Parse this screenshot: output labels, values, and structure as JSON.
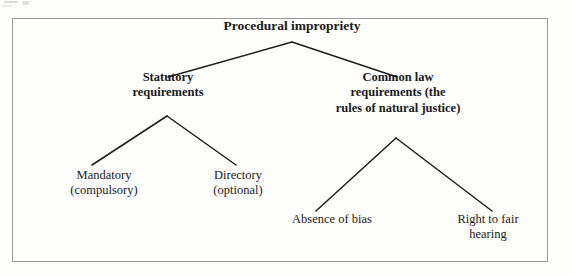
{
  "diagram": {
    "type": "tree",
    "title_node": "Procedural impropriety",
    "nodes": {
      "root": {
        "label": "Procedural impropriety",
        "lines": [
          "Procedural impropriety"
        ],
        "emphasis": "bold"
      },
      "statutory": {
        "label": "Statutory requirements",
        "lines": [
          "Statutory",
          "requirements"
        ],
        "emphasis": "bold"
      },
      "common_law": {
        "label": "Common law requirements (the rules of natural justice)",
        "lines": [
          "Common law",
          "requirements (the",
          "rules of natural justice)"
        ],
        "emphasis": "bold"
      },
      "mandatory": {
        "label": "Mandatory (compulsory)",
        "lines": [
          "Mandatory",
          "(compulsory)"
        ],
        "emphasis": "regular"
      },
      "directory": {
        "label": "Directory (optional)",
        "lines": [
          "Directory",
          "(optional)"
        ],
        "emphasis": "regular"
      },
      "absence_of_bias": {
        "label": "Absence of bias",
        "lines": [
          "Absence of bias"
        ],
        "emphasis": "regular"
      },
      "right_to_fair_hearing": {
        "label": "Right to fair hearing",
        "lines": [
          "Right to fair",
          "hearing"
        ],
        "emphasis": "regular"
      }
    },
    "edges": [
      {
        "from": "root",
        "to": "statutory"
      },
      {
        "from": "root",
        "to": "common_law"
      },
      {
        "from": "statutory",
        "to": "mandatory"
      },
      {
        "from": "statutory",
        "to": "directory"
      },
      {
        "from": "common_law",
        "to": "absence_of_bias"
      },
      {
        "from": "common_law",
        "to": "right_to_fair_hearing"
      }
    ],
    "colors": {
      "text": "#1a1a1a",
      "line": "#1d1d1d",
      "frame": "#9a9a9a",
      "background": "#fdfdfc"
    }
  }
}
